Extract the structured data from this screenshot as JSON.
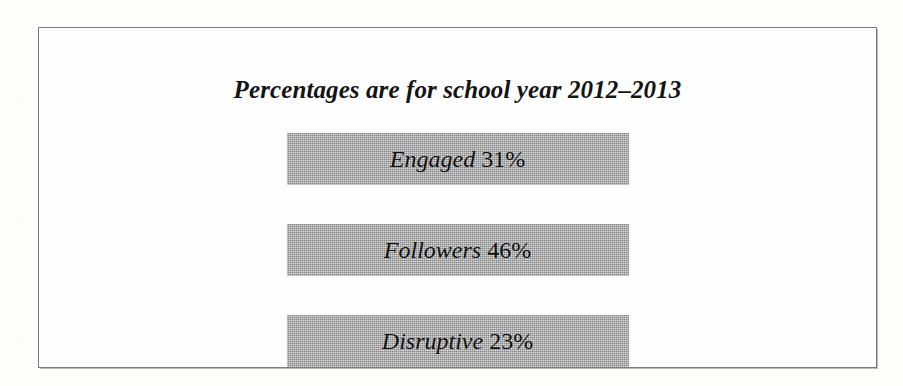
{
  "figure": {
    "title": "Percentages are for school year 2012–2013",
    "border_color": "#7c7c80",
    "background_color": "#fefefe",
    "bar_color": "#a9a9a9",
    "text_color": "#101010"
  },
  "chart_data": {
    "type": "bar",
    "title": "Percentages are for school year 2012–2013",
    "xlabel": "",
    "ylabel": "",
    "orientation": "horizontal",
    "grid": false,
    "legend": false,
    "units": "percent",
    "period": "2012–2013",
    "categories": [
      "Engaged",
      "Followers",
      "Disruptive"
    ],
    "values": [
      31,
      46,
      23
    ],
    "value_labels": [
      "31%",
      "46%",
      "23%"
    ],
    "bars": [
      {
        "category": "Engaged",
        "value": 31,
        "value_label": "31%"
      },
      {
        "category": "Followers",
        "value": 46,
        "value_label": "46%"
      },
      {
        "category": "Disruptive",
        "value": 23,
        "value_label": "23%"
      }
    ],
    "note": "All bars are drawn the same length; the percentage is printed inside each bar."
  }
}
